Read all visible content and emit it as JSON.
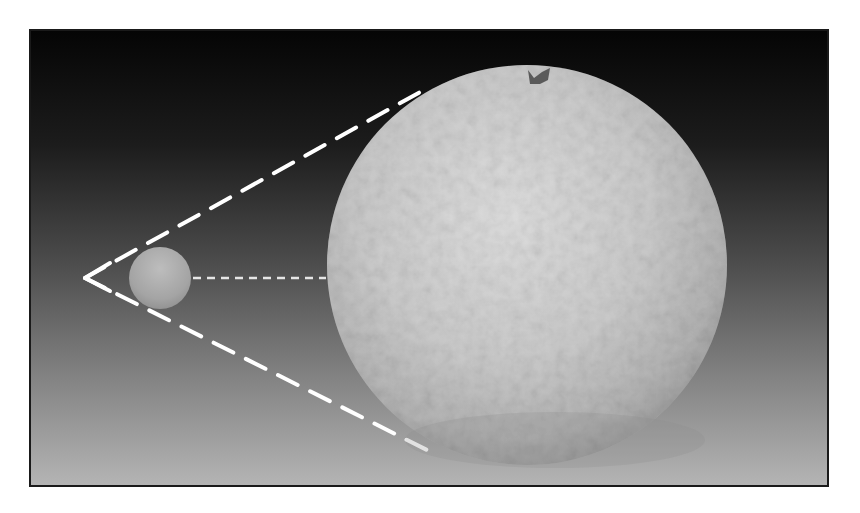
{
  "figure": {
    "frame": {
      "x": 29,
      "y": 29,
      "width": 800,
      "height": 458,
      "border_color": "#1a1a1a"
    },
    "background_gradient": [
      "#050505",
      "#1c1c1c",
      "#4a4a4a",
      "#808080",
      "#b4b4b4"
    ],
    "large_orange": {
      "cx": 527,
      "cy": 265,
      "r": 200,
      "fill": "#c9c9c9",
      "stem_color": "#5a5a5a"
    },
    "small_sphere": {
      "cx": 160,
      "cy": 278,
      "r": 31,
      "fill": "#a8a8a8"
    },
    "projection_lines": {
      "apex": {
        "x": 85,
        "y": 278
      },
      "upper_end": {
        "x": 422,
        "y": 91
      },
      "lower_end": {
        "x": 431,
        "y": 452
      },
      "color": "#ffffff",
      "dash": "22 14",
      "width": 4
    },
    "center_line": {
      "from": {
        "x": 193,
        "y": 278
      },
      "to": {
        "x": 326,
        "y": 278
      },
      "color": "#e6e6e6",
      "dash": "8 6",
      "width": 2.5
    }
  }
}
